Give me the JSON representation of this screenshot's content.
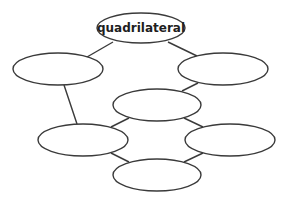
{
  "diagram": {
    "type": "concept-map",
    "stroke_color": "#3a3a3a",
    "background": "#ffffff",
    "nodes": [
      {
        "id": "top",
        "label": "quadrilateral",
        "cx": 141,
        "cy": 28,
        "rx": 44,
        "ry": 15
      },
      {
        "id": "left",
        "label": "",
        "cx": 58,
        "cy": 69,
        "rx": 45,
        "ry": 16
      },
      {
        "id": "right",
        "label": "",
        "cx": 223,
        "cy": 69,
        "rx": 45,
        "ry": 16
      },
      {
        "id": "middle",
        "label": "",
        "cx": 157,
        "cy": 105,
        "rx": 44,
        "ry": 16
      },
      {
        "id": "lower-left",
        "label": "",
        "cx": 83,
        "cy": 140,
        "rx": 45,
        "ry": 16
      },
      {
        "id": "lower-right",
        "label": "",
        "cx": 230,
        "cy": 140,
        "rx": 45,
        "ry": 16
      },
      {
        "id": "bottom",
        "label": "",
        "cx": 157,
        "cy": 175,
        "rx": 44,
        "ry": 16
      }
    ],
    "edges": [
      {
        "from": "top",
        "to": "left",
        "x1": 113,
        "y1": 42,
        "x2": 87,
        "y2": 57
      },
      {
        "from": "top",
        "to": "right",
        "x1": 168,
        "y1": 42,
        "x2": 197,
        "y2": 56
      },
      {
        "from": "left",
        "to": "lower-left",
        "x1": 64,
        "y1": 85,
        "x2": 77,
        "y2": 124
      },
      {
        "from": "right",
        "to": "middle",
        "x1": 198,
        "y1": 83,
        "x2": 182,
        "y2": 91
      },
      {
        "from": "middle",
        "to": "lower-left",
        "x1": 129,
        "y1": 118,
        "x2": 111,
        "y2": 127
      },
      {
        "from": "middle",
        "to": "lower-right",
        "x1": 184,
        "y1": 118,
        "x2": 203,
        "y2": 127
      },
      {
        "from": "lower-left",
        "to": "bottom",
        "x1": 111,
        "y1": 153,
        "x2": 129,
        "y2": 162
      },
      {
        "from": "lower-right",
        "to": "bottom",
        "x1": 203,
        "y1": 153,
        "x2": 184,
        "y2": 162
      }
    ]
  }
}
